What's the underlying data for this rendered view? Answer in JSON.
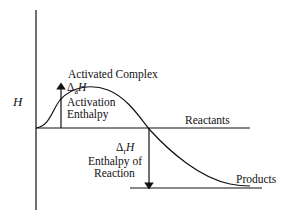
{
  "diagram": {
    "axis_label": "H",
    "peak_label": "Activated Complex",
    "activation_symbol": "Δ",
    "activation_subscript": "a",
    "activation_var": "H",
    "activation_line1": "Activation",
    "activation_line2": "Enthalpy",
    "reactants_label": "Reactants",
    "reaction_symbol": "Δ",
    "reaction_subscript": "r",
    "reaction_var": "H",
    "reaction_line1": "Enthalpy of",
    "reaction_line2": "Reaction",
    "products_label": "Products",
    "line_color": "#111111"
  }
}
